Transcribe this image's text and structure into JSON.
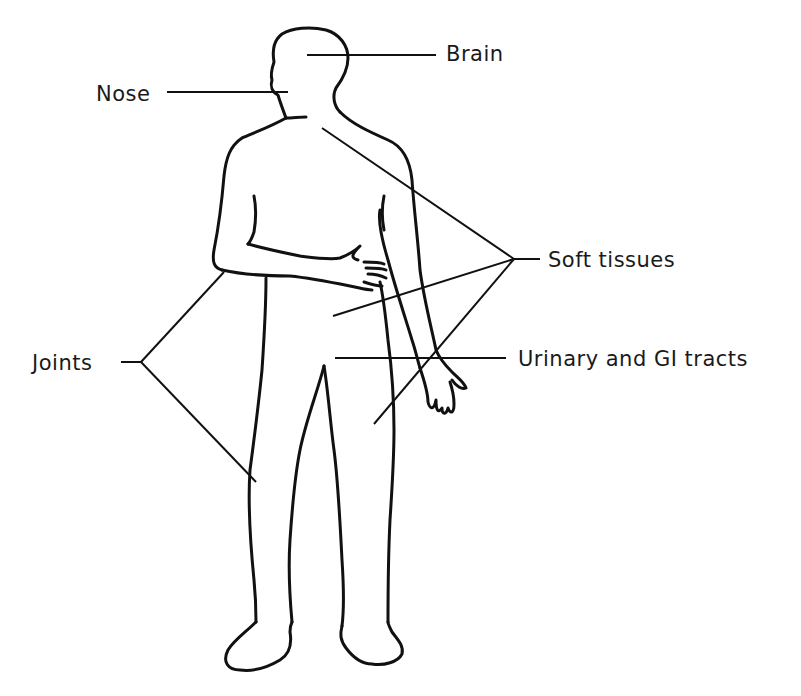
{
  "diagram": {
    "colors": {
      "line": "#111111",
      "text": "#1a1a1a",
      "background": "#ffffff"
    },
    "labels": {
      "brain": "Brain",
      "nose": "Nose",
      "soft_tissues": "Soft tissues",
      "joints": "Joints",
      "urinary_gi": "Urinary and GI tracts"
    }
  }
}
